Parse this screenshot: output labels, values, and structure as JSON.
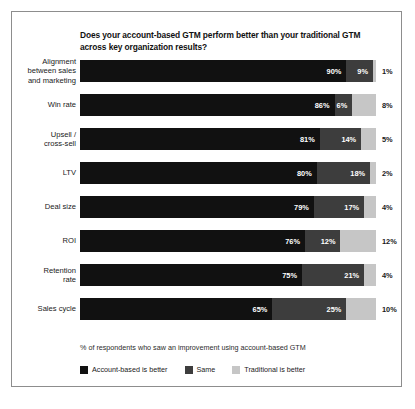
{
  "chart_data": {
    "type": "bar",
    "subtype": "stacked-horizontal-100",
    "title": "Does your account-based GTM perform better than your traditional GTM across key organization results?",
    "xlabel": "% of respondents who saw an improvement using account-based GTM",
    "ylabel": "",
    "xlim": [
      0,
      100
    ],
    "grid": false,
    "legend_position": "bottom",
    "categories": [
      "Alignment between sales and marketing",
      "Win rate",
      "Upsell / cross-sell",
      "LTV",
      "Deal size",
      "ROI",
      "Retention rate",
      "Sales cycle"
    ],
    "series": [
      {
        "name": "Account-based is better",
        "color": "#111111",
        "values": [
          90,
          86,
          81,
          80,
          79,
          76,
          75,
          65
        ]
      },
      {
        "name": "Same",
        "color": "#3d3d3d",
        "values": [
          9,
          6,
          14,
          18,
          17,
          12,
          21,
          25
        ]
      },
      {
        "name": "Traditional is better",
        "color": "#c6c6c6",
        "values": [
          1,
          8,
          5,
          2,
          4,
          12,
          4,
          10
        ]
      }
    ]
  },
  "rows": [
    {
      "label": "Alignment between sales and marketing",
      "label_lines": [
        "Alignment",
        "between sales",
        "and marketing"
      ],
      "a": 90,
      "b": 9,
      "c": 1,
      "a_text": "90%",
      "b_text": "9%",
      "c_text": "1%"
    },
    {
      "label": "Win rate",
      "label_lines": [
        "Win rate"
      ],
      "a": 86,
      "b": 6,
      "c": 8,
      "a_text": "86%",
      "b_text": "6%",
      "c_text": "8%"
    },
    {
      "label": "Upsell / cross-sell",
      "label_lines": [
        "Upsell /",
        "cross-sell"
      ],
      "a": 81,
      "b": 14,
      "c": 5,
      "a_text": "81%",
      "b_text": "14%",
      "c_text": "5%"
    },
    {
      "label": "LTV",
      "label_lines": [
        "LTV"
      ],
      "a": 80,
      "b": 18,
      "c": 2,
      "a_text": "80%",
      "b_text": "18%",
      "c_text": "2%"
    },
    {
      "label": "Deal size",
      "label_lines": [
        "Deal size"
      ],
      "a": 79,
      "b": 17,
      "c": 4,
      "a_text": "79%",
      "b_text": "17%",
      "c_text": "4%"
    },
    {
      "label": "ROI",
      "label_lines": [
        "ROI"
      ],
      "a": 76,
      "b": 12,
      "c": 12,
      "a_text": "76%",
      "b_text": "12%",
      "c_text": "12%"
    },
    {
      "label": "Retention rate",
      "label_lines": [
        "Retention",
        "rate"
      ],
      "a": 75,
      "b": 21,
      "c": 4,
      "a_text": "75%",
      "b_text": "21%",
      "c_text": "4%"
    },
    {
      "label": "Sales cycle",
      "label_lines": [
        "Sales cycle"
      ],
      "a": 65,
      "b": 25,
      "c": 10,
      "a_text": "65%",
      "b_text": "25%",
      "c_text": "10%"
    }
  ],
  "legend": [
    {
      "label": "Account-based is better",
      "color": "#111111"
    },
    {
      "label": "Same",
      "color": "#3d3d3d"
    },
    {
      "label": "Traditional is better",
      "color": "#c6c6c6"
    }
  ],
  "caption": {
    "text": "",
    "visible": false
  },
  "colors": {
    "account_based": "#111111",
    "same": "#3d3d3d",
    "traditional": "#c6c6c6",
    "frame": "#8d8d8d",
    "text": "#1a1a1a"
  }
}
